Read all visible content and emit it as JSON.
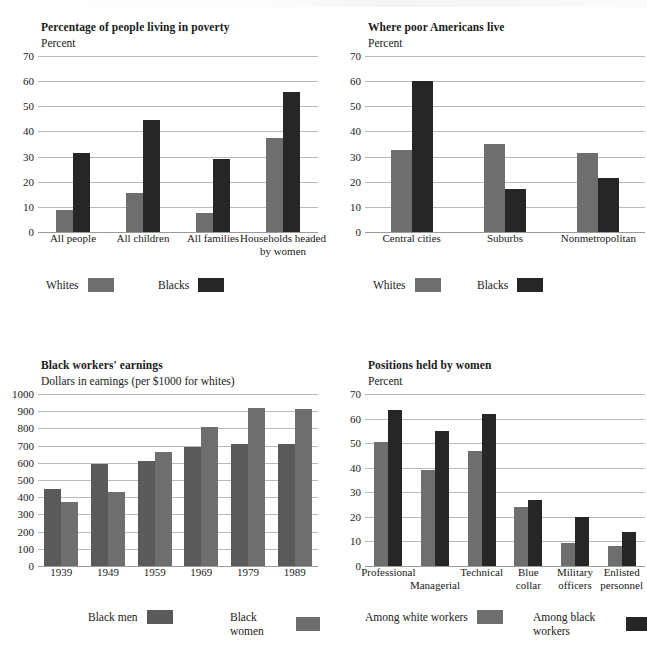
{
  "document": {
    "kind": "figure-page",
    "chart_count": 4
  },
  "legend_labels": {
    "whites": "Whites",
    "blacks": "Blacks",
    "black_men": "Black men",
    "black_women": "Black women",
    "among_white_workers": "Among white workers",
    "among_black_workers": "Among black workers"
  },
  "colors": {
    "light_gray": "#6e6e6e",
    "mid_gray": "#636363",
    "dark_gray": "#5a5a5a",
    "near_black": "#262626",
    "gridline": "#b9b9b9",
    "text": "#1a1a1a",
    "background": "#ffffff"
  },
  "chart_data": [
    {
      "id": "poverty",
      "type": "bar",
      "title": "Percentage of people living in poverty",
      "subtitle": "Percent",
      "ylabel": "Percent",
      "xlabel": "",
      "ylim": [
        0,
        70
      ],
      "yticks": [
        0,
        10,
        20,
        30,
        40,
        50,
        60,
        70
      ],
      "ytick_labels": [
        "0",
        "10",
        "20",
        "30",
        "40",
        "50",
        "60",
        "70"
      ],
      "grid": true,
      "legend_position": "below",
      "categories": [
        "All people",
        "All children",
        "All families",
        "Households headed by women"
      ],
      "series": [
        {
          "name": "Whites",
          "color": "#6e6e6e",
          "values": [
            8.8,
            15.5,
            7.5,
            37.5
          ]
        },
        {
          "name": "Blacks",
          "color": "#262626",
          "values": [
            31.5,
            44.5,
            29.0,
            55.5
          ]
        }
      ]
    },
    {
      "id": "where-poor-live",
      "type": "bar",
      "title": "Where poor Americans live",
      "subtitle": "Percent",
      "ylabel": "Percent",
      "xlabel": "",
      "ylim": [
        0,
        70
      ],
      "yticks": [
        0,
        10,
        20,
        30,
        40,
        50,
        60,
        70
      ],
      "ytick_labels": [
        "0",
        "10",
        "20",
        "30",
        "40",
        "50",
        "60",
        "70"
      ],
      "grid": true,
      "legend_position": "below",
      "categories": [
        "Central cities",
        "Suburbs",
        "Nonmetropolitan"
      ],
      "series": [
        {
          "name": "Whites",
          "color": "#6e6e6e",
          "values": [
            32.5,
            35.0,
            31.5
          ]
        },
        {
          "name": "Blacks",
          "color": "#262626",
          "values": [
            60.0,
            17.0,
            21.5
          ]
        }
      ]
    },
    {
      "id": "black-workers-earnings",
      "type": "bar",
      "title": "Black workers' earnings",
      "subtitle": "Dollars in earnings (per $1000 for whites)",
      "ylabel": "Dollars in earnings (per $1000 for whites)",
      "xlabel": "",
      "ylim": [
        0,
        1000
      ],
      "yticks": [
        0,
        100,
        200,
        300,
        400,
        500,
        600,
        700,
        800,
        900,
        1000
      ],
      "ytick_labels": [
        "0",
        "100",
        "200",
        "300",
        "400",
        "500",
        "600",
        "700",
        "800",
        "900",
        "1000"
      ],
      "grid": true,
      "legend_position": "below",
      "categories": [
        "1939",
        "1949",
        "1959",
        "1969",
        "1979",
        "1989"
      ],
      "series": [
        {
          "name": "Black men",
          "color": "#5a5a5a",
          "values": [
            445,
            595,
            610,
            690,
            710,
            710
          ]
        },
        {
          "name": "Black women",
          "color": "#6e6e6e",
          "values": [
            375,
            430,
            660,
            810,
            920,
            910
          ]
        }
      ]
    },
    {
      "id": "positions-held-by-women",
      "type": "bar",
      "title": "Positions held by women",
      "subtitle": "Percent",
      "ylabel": "Percent",
      "xlabel": "",
      "ylim": [
        0,
        70
      ],
      "yticks": [
        0,
        10,
        20,
        30,
        40,
        50,
        60,
        70
      ],
      "ytick_labels": [
        "0",
        "10",
        "20",
        "30",
        "40",
        "50",
        "60",
        "70"
      ],
      "grid": true,
      "legend_position": "below",
      "categories": [
        "Professional",
        "Managerial",
        "Technical",
        "Blue collar",
        "Military officers",
        "Enlisted personnel"
      ],
      "series": [
        {
          "name": "Among white workers",
          "color": "#6e6e6e",
          "values": [
            50.5,
            39.0,
            47.0,
            24.0,
            9.5,
            8.0
          ]
        },
        {
          "name": "Among black workers",
          "color": "#262626",
          "values": [
            63.5,
            55.0,
            62.0,
            27.0,
            20.0,
            13.8
          ]
        }
      ]
    }
  ]
}
